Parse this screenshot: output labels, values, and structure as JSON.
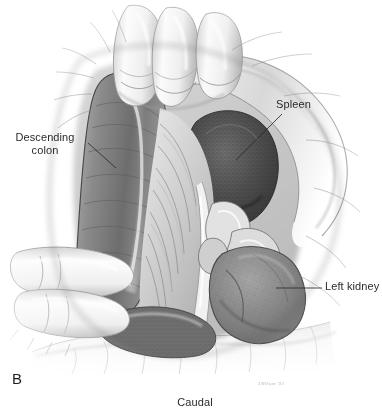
{
  "figure": {
    "panel_letter": "B",
    "orientation_label": "Caudal",
    "artist_signature": "LWilson '93",
    "background_color": "#ffffff",
    "ink_color": "#2b2b2b",
    "type": "grayscale pencil surgical anatomy illustration"
  },
  "labels": [
    {
      "id": "descending-colon",
      "text": "Descending\ncolon",
      "leader_from": [
        88,
        143
      ],
      "leader_to": [
        116,
        168
      ]
    },
    {
      "id": "spleen",
      "text": "Spleen",
      "leader_from": [
        282,
        114
      ],
      "leader_to": [
        236,
        160
      ]
    },
    {
      "id": "left-kidney",
      "text": "Left kidney",
      "leader_from": [
        322,
        288
      ],
      "leader_to": [
        276,
        288
      ]
    }
  ],
  "anatomy": {
    "descending_colon": {
      "name": "Descending colon",
      "tone": "#8d8d8d",
      "description": "thick tubular bowel retracted toward the left of the field"
    },
    "spleen": {
      "name": "Spleen",
      "tone": "#4a4a4a",
      "description": "dark stippled parenchymal mass in the upper right of the field"
    },
    "left_kidney": {
      "name": "Left kidney",
      "tone": "#7e7e7e",
      "description": "mottled reniform mass in the lower right of the field"
    },
    "mesentery": {
      "name": "Mesentery",
      "tone": "#c7c7c7",
      "description": "fan of radiating folds in the centre of the field"
    },
    "retracting_fingers_superior": {
      "name": "Retracting fingers (superior)",
      "tone": "#e4e4e4",
      "count": 3
    },
    "retracting_fingers_lateral": {
      "name": "Retracting fingers (lateral)",
      "tone": "#ececec",
      "count": 2
    },
    "surgical_drape": {
      "name": "Surgical drape",
      "tone": "#f2f2f2",
      "description": "folded cloth draping the inferior border of the field"
    }
  }
}
